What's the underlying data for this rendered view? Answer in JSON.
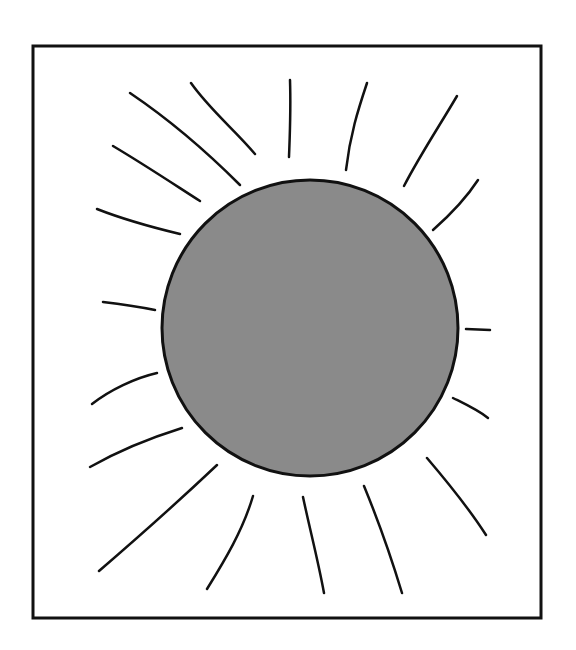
{
  "drawing": {
    "subject": "sun",
    "frame": {
      "x": 33,
      "y": 46,
      "width": 508,
      "height": 572,
      "stroke": "#111111"
    },
    "sun_disc": {
      "cx": 310,
      "cy": 328,
      "r": 148,
      "fill": "#8a8a8a",
      "stroke": "#111111"
    },
    "ray_color": "#111111",
    "ray_count": 20
  }
}
